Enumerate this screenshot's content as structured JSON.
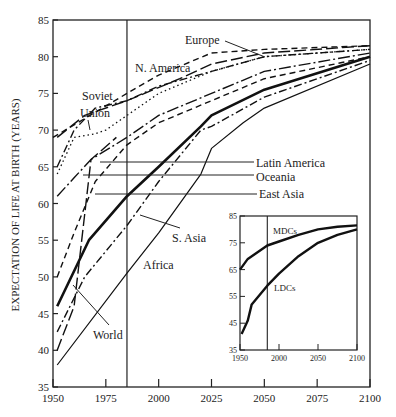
{
  "chart_data": {
    "type": "line",
    "title": "",
    "xlabel": "",
    "ylabel": "EXPECTATION OF LIFE AT BIRTH (YEARS)",
    "xlim": [
      1950,
      2100
    ],
    "ylim": [
      35,
      85
    ],
    "x_ticks": [
      1950,
      1975,
      2000,
      2025,
      2050,
      2075,
      2100
    ],
    "y_ticks": [
      35,
      40,
      45,
      50,
      55,
      60,
      65,
      70,
      75,
      80,
      85
    ],
    "grid": false,
    "legend": "inline labels",
    "vertical_marker_year": 1985,
    "series": [
      {
        "name": "Europe",
        "style": "dashed",
        "points": [
          [
            1950,
            69
          ],
          [
            1985,
            75
          ],
          [
            2000,
            77.5
          ],
          [
            2025,
            80.5
          ],
          [
            2050,
            81
          ],
          [
            2100,
            81.5
          ]
        ]
      },
      {
        "name": "N. America",
        "style": "long-dash",
        "points": [
          [
            1952,
            69
          ],
          [
            1965,
            72
          ],
          [
            1985,
            74
          ],
          [
            2010,
            77
          ],
          [
            2025,
            79
          ],
          [
            2050,
            80.5
          ],
          [
            2100,
            81.5
          ]
        ]
      },
      {
        "name": "Soviet Union",
        "style": "dotted",
        "points": [
          [
            1952,
            64
          ],
          [
            1960,
            69
          ],
          [
            1970,
            69.5
          ],
          [
            1975,
            70
          ],
          [
            1985,
            72
          ],
          [
            2000,
            75
          ],
          [
            2025,
            78
          ],
          [
            2050,
            80
          ],
          [
            2100,
            81
          ]
        ]
      },
      {
        "name": "Oceania",
        "style": "dash-dot",
        "points": [
          [
            1952,
            65
          ],
          [
            1960,
            70
          ],
          [
            1970,
            73
          ],
          [
            1985,
            74
          ],
          [
            2000,
            76
          ],
          [
            2025,
            78
          ],
          [
            2050,
            80
          ],
          [
            2100,
            81
          ]
        ]
      },
      {
        "name": "Latin America",
        "style": "long-dash-dot",
        "points": [
          [
            1952,
            61
          ],
          [
            1960,
            63.5
          ],
          [
            1968,
            66
          ],
          [
            1985,
            69
          ],
          [
            2000,
            72
          ],
          [
            2025,
            75
          ],
          [
            2050,
            78
          ],
          [
            2100,
            80.5
          ]
        ]
      },
      {
        "name": "East Asia",
        "style": "dashed",
        "points": [
          [
            1952,
            50
          ],
          [
            1960,
            56
          ],
          [
            1970,
            63
          ],
          [
            1985,
            68
          ],
          [
            2000,
            71
          ],
          [
            2025,
            74
          ],
          [
            2050,
            77
          ],
          [
            2100,
            80
          ]
        ]
      },
      {
        "name": "World",
        "style": "solid-thick",
        "points": [
          [
            1952,
            46
          ],
          [
            1967,
            55
          ],
          [
            1985,
            61
          ],
          [
            2000,
            65
          ],
          [
            2020,
            70.5
          ],
          [
            2025,
            72
          ],
          [
            2050,
            75.5
          ],
          [
            2100,
            80
          ]
        ]
      },
      {
        "name": "S. Asia",
        "style": "dash-dot",
        "points": [
          [
            1952,
            42.5
          ],
          [
            1965,
            50
          ],
          [
            1985,
            57
          ],
          [
            2000,
            63
          ],
          [
            2020,
            70
          ],
          [
            2025,
            70.5
          ],
          [
            2050,
            74.5
          ],
          [
            2100,
            79.5
          ]
        ]
      },
      {
        "name": "Africa",
        "style": "solid-thin",
        "points": [
          [
            1952,
            38
          ],
          [
            1985,
            50.5
          ],
          [
            2000,
            56
          ],
          [
            2020,
            64
          ],
          [
            2025,
            67.5
          ],
          [
            2040,
            71
          ],
          [
            2050,
            73
          ],
          [
            2100,
            79
          ]
        ]
      },
      {
        "name": "Latin America (early)",
        "style": "long-dash",
        "points": [
          [
            1952,
            40
          ],
          [
            1960,
            46
          ],
          [
            1968,
            66
          ],
          [
            1980,
            69
          ]
        ]
      }
    ],
    "labels": [
      "Europe",
      "N. America",
      "Soviet Union",
      "Latin America",
      "Oceania",
      "East Asia",
      "S. Asia",
      "Africa",
      "World"
    ],
    "inset": {
      "type": "line",
      "xlim": [
        1950,
        2100
      ],
      "ylim": [
        35,
        85
      ],
      "x_ticks": [
        1950,
        2000,
        2050,
        2100
      ],
      "y_ticks": [
        35,
        45,
        55,
        65,
        75,
        85
      ],
      "vertical_marker_year": 1985,
      "series": [
        {
          "name": "MDCs",
          "points": [
            [
              1950,
              65
            ],
            [
              1960,
              69
            ],
            [
              1985,
              74
            ],
            [
              2000,
              75.5
            ],
            [
              2025,
              78
            ],
            [
              2050,
              80
            ],
            [
              2075,
              81
            ],
            [
              2100,
              81.5
            ]
          ]
        },
        {
          "name": "LDCs",
          "points": [
            [
              1952,
              41
            ],
            [
              1960,
              46
            ],
            [
              1965,
              52
            ],
            [
              1985,
              59
            ],
            [
              2000,
              63.5
            ],
            [
              2025,
              70
            ],
            [
              2050,
              75
            ],
            [
              2075,
              78
            ],
            [
              2100,
              80
            ]
          ]
        }
      ]
    }
  }
}
